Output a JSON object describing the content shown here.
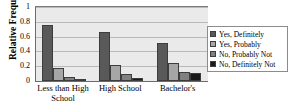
{
  "chart_data": {
    "type": "bar",
    "title": "",
    "xlabel": "",
    "ylabel": "Relative Frequency",
    "ylim": [
      0,
      1
    ],
    "yticks": [
      "0",
      "0.2",
      "0.4",
      "0.6",
      "0.8",
      "1"
    ],
    "ytick_values": [
      0,
      0.2,
      0.4,
      0.6,
      0.8,
      1
    ],
    "grid": true,
    "legend_position": "right",
    "categories": [
      "Less than High School",
      "High School",
      "Bachelor's"
    ],
    "series": [
      {
        "name": "Yes, Definitely",
        "color": "#595959",
        "values": [
          0.76,
          0.66,
          0.51
        ]
      },
      {
        "name": "Yes, Probably",
        "color": "#a6a6a6",
        "values": [
          0.17,
          0.21,
          0.25
        ]
      },
      {
        "name": "No, Probably Not",
        "color": "#808080",
        "values": [
          0.06,
          0.09,
          0.12
        ]
      },
      {
        "name": "No, Definitely Not",
        "color": "#1a1a1a",
        "values": [
          0.03,
          0.04,
          0.11
        ]
      }
    ]
  },
  "axis": {
    "y_title": "Relative Frequency"
  },
  "legend": {
    "items": [
      {
        "label": "Yes, Definitely",
        "color": "#595959"
      },
      {
        "label": "Yes, Probably",
        "color": "#a6a6a6"
      },
      {
        "label": "No, Probably Not",
        "color": "#808080"
      },
      {
        "label": "No, Definitely Not",
        "color": "#1a1a1a"
      }
    ]
  },
  "colors": {
    "plot_background": "#eaeaea",
    "gridline": "#b9b9b9",
    "axis_line": "#6b6b6b",
    "page_background": "#ffffff",
    "text": "#000000"
  }
}
